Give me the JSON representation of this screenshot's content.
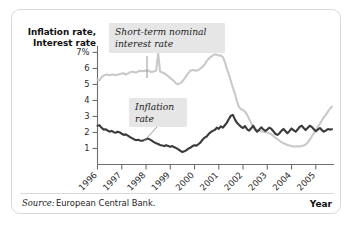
{
  "figure": {
    "y_axis_title_line1": "Inflation rate,",
    "y_axis_title_line2": "Interest rate",
    "x_axis_title": "Year",
    "source_prefix": "Source:",
    "source_text": "European Central Bank.",
    "callout_interest_line1": "Short-term nominal",
    "callout_interest_line2": "interest rate",
    "callout_inflation_line1": "Inflation",
    "callout_inflation_line2": "rate",
    "colors": {
      "interest_rate_line": "#c9c9c9",
      "inflation_rate_line": "#3a3a3a",
      "callout_background": "#e6e6e6",
      "axis": "#6e6e6e",
      "panel_border": "#d9d9d9",
      "panel_background": "#ffffff"
    }
  },
  "chart_data": {
    "type": "line",
    "title": "",
    "subtitle": "",
    "xlabel": "Year",
    "ylabel": "Inflation rate, Interest rate",
    "xlim": [
      1996.0,
      2005.75
    ],
    "ylim": [
      0.0,
      7.4
    ],
    "grid": false,
    "legend_position": "annotations-on-plot",
    "ytick_labels": [
      "7%",
      "6",
      "5",
      "4",
      "3",
      "2",
      "1"
    ],
    "ytick_values": [
      7,
      6,
      5,
      4,
      3,
      2,
      1
    ],
    "xtick_labels": [
      "1996",
      "1997",
      "1998",
      "1999",
      "2000",
      "2001",
      "2002",
      "2003",
      "2004",
      "2005"
    ],
    "xtick_values": [
      1996,
      1997,
      1998,
      1999,
      2000,
      2001,
      2002,
      2003,
      2004,
      2005
    ],
    "annotations": [
      {
        "text": "Short-term nominal interest rate",
        "series": "Short-term nominal interest rate"
      },
      {
        "text": "Inflation rate",
        "series": "Inflation rate"
      }
    ],
    "source": "Source: European Central Bank.",
    "series": [
      {
        "name": "Short-term nominal interest rate",
        "color": "#c9c9c9",
        "x": [
          1996.0,
          1996.08,
          1996.17,
          1996.25,
          1996.33,
          1996.42,
          1996.5,
          1996.58,
          1996.67,
          1996.75,
          1996.83,
          1996.92,
          1997.0,
          1997.08,
          1997.17,
          1997.25,
          1997.33,
          1997.42,
          1997.5,
          1997.58,
          1997.67,
          1997.75,
          1997.83,
          1997.92,
          1998.0,
          1998.08,
          1998.17,
          1998.25,
          1998.33,
          1998.42,
          1998.5,
          1998.58,
          1998.67,
          1998.75,
          1998.83,
          1998.92,
          1999.0,
          1999.08,
          1999.17,
          1999.25,
          1999.33,
          1999.42,
          1999.5,
          1999.58,
          1999.67,
          1999.75,
          1999.83,
          1999.92,
          2000.0,
          2000.08,
          2000.17,
          2000.25,
          2000.33,
          2000.42,
          2000.5,
          2000.58,
          2000.67,
          2000.75,
          2000.83,
          2000.92,
          2001.0,
          2001.08,
          2001.17,
          2001.25,
          2001.33,
          2001.42,
          2001.5,
          2001.58,
          2001.67,
          2001.75,
          2001.83,
          2001.92,
          2002.0,
          2002.08,
          2002.17,
          2002.25,
          2002.33,
          2002.42,
          2002.5,
          2002.58,
          2002.67,
          2002.75,
          2002.83,
          2002.92,
          2003.0,
          2003.08,
          2003.17,
          2003.25,
          2003.33,
          2003.42,
          2003.5,
          2003.58,
          2003.67,
          2003.75,
          2003.83,
          2003.92,
          2004.0,
          2004.08,
          2004.17,
          2004.25,
          2004.33,
          2004.42,
          2004.5,
          2004.58,
          2004.67,
          2004.75,
          2004.83,
          2004.92,
          2005.0,
          2005.08,
          2005.17,
          2005.25,
          2005.33,
          2005.42,
          2005.5,
          2005.58,
          2005.67
        ],
        "y": [
          5.3,
          5.25,
          5.45,
          5.55,
          5.6,
          5.62,
          5.58,
          5.6,
          5.62,
          5.58,
          5.6,
          5.65,
          5.68,
          5.7,
          5.62,
          5.68,
          5.75,
          5.8,
          5.78,
          5.74,
          5.8,
          5.85,
          5.82,
          5.86,
          5.84,
          5.88,
          5.8,
          5.78,
          5.82,
          5.86,
          6.95,
          5.8,
          5.74,
          5.7,
          5.62,
          5.5,
          5.4,
          5.3,
          5.18,
          5.05,
          5.02,
          5.08,
          5.2,
          5.35,
          5.55,
          5.72,
          5.85,
          5.9,
          5.88,
          5.86,
          5.9,
          6.0,
          6.1,
          6.25,
          6.45,
          6.6,
          6.72,
          6.8,
          6.88,
          6.85,
          6.8,
          6.82,
          6.7,
          6.4,
          6.0,
          5.6,
          5.2,
          4.8,
          4.4,
          3.95,
          3.6,
          3.45,
          3.4,
          3.3,
          3.1,
          2.85,
          2.6,
          2.4,
          2.25,
          2.15,
          2.1,
          2.08,
          2.05,
          2.02,
          2.0,
          1.95,
          1.88,
          1.78,
          1.68,
          1.58,
          1.48,
          1.4,
          1.33,
          1.28,
          1.22,
          1.18,
          1.15,
          1.12,
          1.12,
          1.14,
          1.12,
          1.15,
          1.18,
          1.25,
          1.38,
          1.55,
          1.75,
          1.95,
          2.15,
          2.35,
          2.55,
          2.75,
          2.95,
          3.12,
          3.3,
          3.48,
          3.62
        ]
      },
      {
        "name": "Inflation rate",
        "color": "#3a3a3a",
        "x": [
          1996.0,
          1996.08,
          1996.17,
          1996.25,
          1996.33,
          1996.42,
          1996.5,
          1996.58,
          1996.67,
          1996.75,
          1996.83,
          1996.92,
          1997.0,
          1997.08,
          1997.17,
          1997.25,
          1997.33,
          1997.42,
          1997.5,
          1997.58,
          1997.67,
          1997.75,
          1997.83,
          1997.92,
          1998.0,
          1998.08,
          1998.17,
          1998.25,
          1998.33,
          1998.42,
          1998.5,
          1998.58,
          1998.67,
          1998.75,
          1998.83,
          1998.92,
          1999.0,
          1999.08,
          1999.17,
          1999.25,
          1999.33,
          1999.42,
          1999.5,
          1999.58,
          1999.67,
          1999.75,
          1999.83,
          1999.92,
          2000.0,
          2000.08,
          2000.17,
          2000.25,
          2000.33,
          2000.42,
          2000.5,
          2000.58,
          2000.67,
          2000.75,
          2000.83,
          2000.92,
          2001.0,
          2001.08,
          2001.17,
          2001.25,
          2001.33,
          2001.42,
          2001.5,
          2001.58,
          2001.67,
          2001.75,
          2001.83,
          2001.92,
          2002.0,
          2002.08,
          2002.17,
          2002.25,
          2002.33,
          2002.42,
          2002.5,
          2002.58,
          2002.67,
          2002.75,
          2002.83,
          2002.92,
          2003.0,
          2003.08,
          2003.17,
          2003.25,
          2003.33,
          2003.42,
          2003.5,
          2003.58,
          2003.67,
          2003.75,
          2003.83,
          2003.92,
          2004.0,
          2004.08,
          2004.17,
          2004.25,
          2004.33,
          2004.42,
          2004.5,
          2004.58,
          2004.67,
          2004.75,
          2004.83,
          2004.92,
          2005.0,
          2005.08,
          2005.17,
          2005.25,
          2005.33,
          2005.42,
          2005.5,
          2005.58,
          2005.67
        ],
        "y": [
          2.42,
          2.45,
          2.3,
          2.18,
          2.2,
          2.12,
          2.05,
          2.1,
          2.02,
          1.98,
          2.05,
          2.0,
          1.92,
          1.85,
          1.88,
          1.8,
          1.72,
          1.65,
          1.58,
          1.52,
          1.55,
          1.5,
          1.48,
          1.52,
          1.58,
          1.62,
          1.55,
          1.48,
          1.4,
          1.32,
          1.28,
          1.22,
          1.18,
          1.15,
          1.2,
          1.15,
          1.1,
          1.15,
          1.08,
          1.02,
          0.95,
          0.85,
          0.78,
          0.82,
          0.9,
          1.0,
          1.05,
          1.15,
          1.2,
          1.18,
          1.28,
          1.38,
          1.55,
          1.68,
          1.75,
          1.9,
          2.02,
          2.1,
          2.15,
          2.3,
          2.22,
          2.38,
          2.3,
          2.45,
          2.6,
          2.85,
          3.05,
          3.1,
          2.8,
          2.6,
          2.48,
          2.35,
          2.28,
          2.4,
          2.2,
          2.12,
          2.25,
          2.42,
          2.18,
          2.05,
          2.18,
          2.32,
          2.2,
          2.1,
          2.18,
          2.3,
          2.22,
          2.08,
          1.92,
          1.85,
          1.95,
          2.1,
          2.22,
          2.08,
          1.95,
          2.1,
          2.25,
          2.15,
          2.05,
          2.18,
          2.35,
          2.42,
          2.28,
          2.15,
          2.3,
          2.42,
          2.35,
          2.2,
          2.08,
          2.18,
          2.28,
          2.15,
          2.05,
          2.12,
          2.22,
          2.18,
          2.2
        ]
      }
    ]
  }
}
